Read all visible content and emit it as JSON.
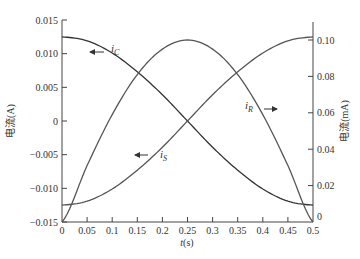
{
  "chart_data": {
    "type": "line",
    "title": "",
    "xlabel": "t(s)",
    "ylabel": "电流(A)",
    "ylabel_right": "电流(mA)",
    "xlim": [
      0,
      0.5
    ],
    "ylim": [
      -0.015,
      0.015
    ],
    "ylim_right": [
      0,
      0.11
    ],
    "grid": false,
    "legend_position": "inline labels with arrows",
    "x_ticks": [
      "0",
      "0.05",
      "0.1",
      "0.15",
      "0.2",
      "0.25",
      "0.3",
      "0.35",
      "0.4",
      "0.45",
      "0.5"
    ],
    "y_ticks_left": [
      "0.015",
      "0.010",
      "0.005",
      "0",
      "-0.005",
      "-0.010",
      "-0.015"
    ],
    "y_ticks_right": [
      "0.10",
      "0.08",
      "0.06",
      "0.04",
      "0.02",
      "0"
    ],
    "x": [
      0,
      0.05,
      0.1,
      0.15,
      0.2,
      0.25,
      0.3,
      0.35,
      0.4,
      0.45,
      0.5
    ],
    "series": [
      {
        "name": "i_C",
        "axis": "left",
        "arrow": "left",
        "values": [
          0.0125,
          0.0119,
          0.0101,
          0.0073,
          0.0039,
          0.0,
          -0.0039,
          -0.0073,
          -0.0101,
          -0.0119,
          -0.0125
        ]
      },
      {
        "name": "i_S",
        "axis": "left",
        "arrow": "left",
        "values": [
          -0.0125,
          -0.0119,
          -0.0101,
          -0.0073,
          -0.0039,
          0.0,
          0.0039,
          0.0073,
          0.0101,
          0.0119,
          0.0125
        ]
      },
      {
        "name": "i_R",
        "axis": "right",
        "arrow": "right",
        "values": [
          0.0,
          0.031,
          0.059,
          0.081,
          0.095,
          0.1,
          0.095,
          0.081,
          0.059,
          0.031,
          0.0
        ]
      }
    ]
  },
  "labels": {
    "xlabel_italic": "t",
    "xlabel_unit": "(s)",
    "ylabel_left": "电流(A)",
    "ylabel_right": "电流(mA)",
    "iC_main": "i",
    "iC_sub": "C",
    "iS_main": "i",
    "iS_sub": "S",
    "iR_main": "i",
    "iR_sub": "R"
  }
}
